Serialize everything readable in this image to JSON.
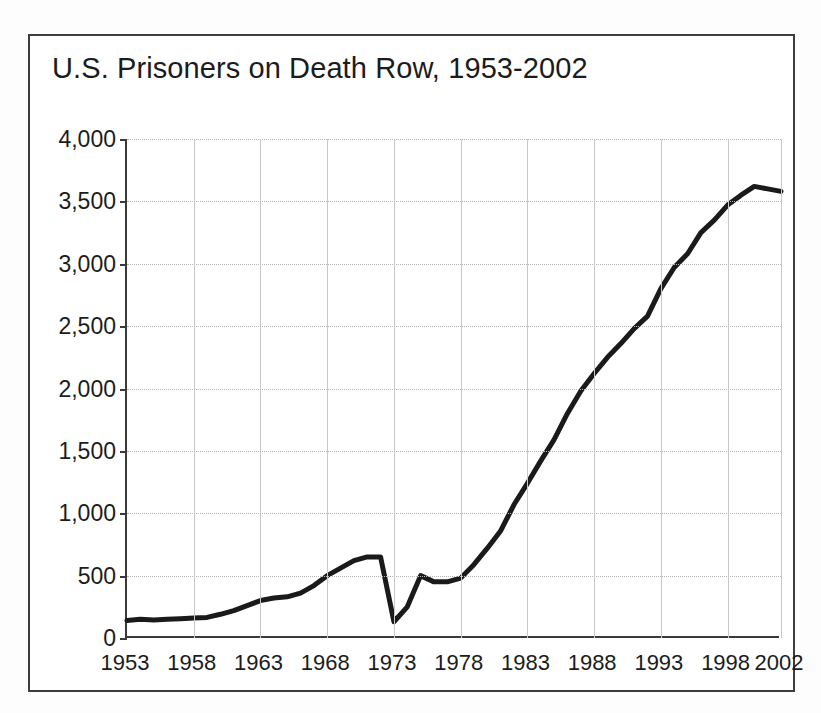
{
  "figure": {
    "title": "U.S. Prisoners on Death Row, 1953-2002",
    "frame_color": "#3d3d3d",
    "background": "#ffffff"
  },
  "chart_data": {
    "type": "line",
    "title": "U.S. Prisoners on Death Row, 1953-2002",
    "xlabel": "",
    "ylabel": "",
    "xlim": [
      1953,
      2002
    ],
    "ylim": [
      0,
      4000
    ],
    "grid": true,
    "legend": "none",
    "line_color": "#1a1a1a",
    "line_width": 5,
    "y_ticks": [
      0,
      500,
      1000,
      1500,
      2000,
      2500,
      3000,
      3500,
      4000
    ],
    "y_tick_labels": [
      "0",
      "500",
      "1,000",
      "1,500",
      "2,000",
      "2,500",
      "3,000",
      "3,500",
      "4,000"
    ],
    "x_ticks": [
      1953,
      1958,
      1963,
      1968,
      1973,
      1978,
      1983,
      1988,
      1993,
      1998,
      2002
    ],
    "x_tick_labels": [
      "1953",
      "1958",
      "1963",
      "1968",
      "1973",
      "1978",
      "1983",
      "1988",
      "1993",
      "1998",
      "2002"
    ],
    "x": [
      1953,
      1954,
      1955,
      1956,
      1957,
      1958,
      1959,
      1960,
      1961,
      1962,
      1963,
      1964,
      1965,
      1966,
      1967,
      1968,
      1969,
      1970,
      1971,
      1972,
      1973,
      1974,
      1975,
      1976,
      1977,
      1978,
      1979,
      1980,
      1981,
      1982,
      1983,
      1984,
      1985,
      1986,
      1987,
      1988,
      1989,
      1990,
      1991,
      1992,
      1993,
      1994,
      1995,
      1996,
      1997,
      1998,
      1999,
      2000,
      2001,
      2002
    ],
    "series": [
      {
        "name": "Prisoners on death row",
        "values": [
          140,
          150,
          145,
          150,
          155,
          160,
          165,
          190,
          220,
          260,
          300,
          320,
          330,
          360,
          420,
          500,
          560,
          620,
          650,
          650,
          130,
          250,
          500,
          450,
          450,
          480,
          590,
          720,
          860,
          1070,
          1240,
          1420,
          1590,
          1800,
          1980,
          2120,
          2250,
          2360,
          2480,
          2580,
          2800,
          2970,
          3080,
          3250,
          3350,
          3470,
          3550,
          3620,
          3600,
          3580
        ]
      }
    ]
  }
}
